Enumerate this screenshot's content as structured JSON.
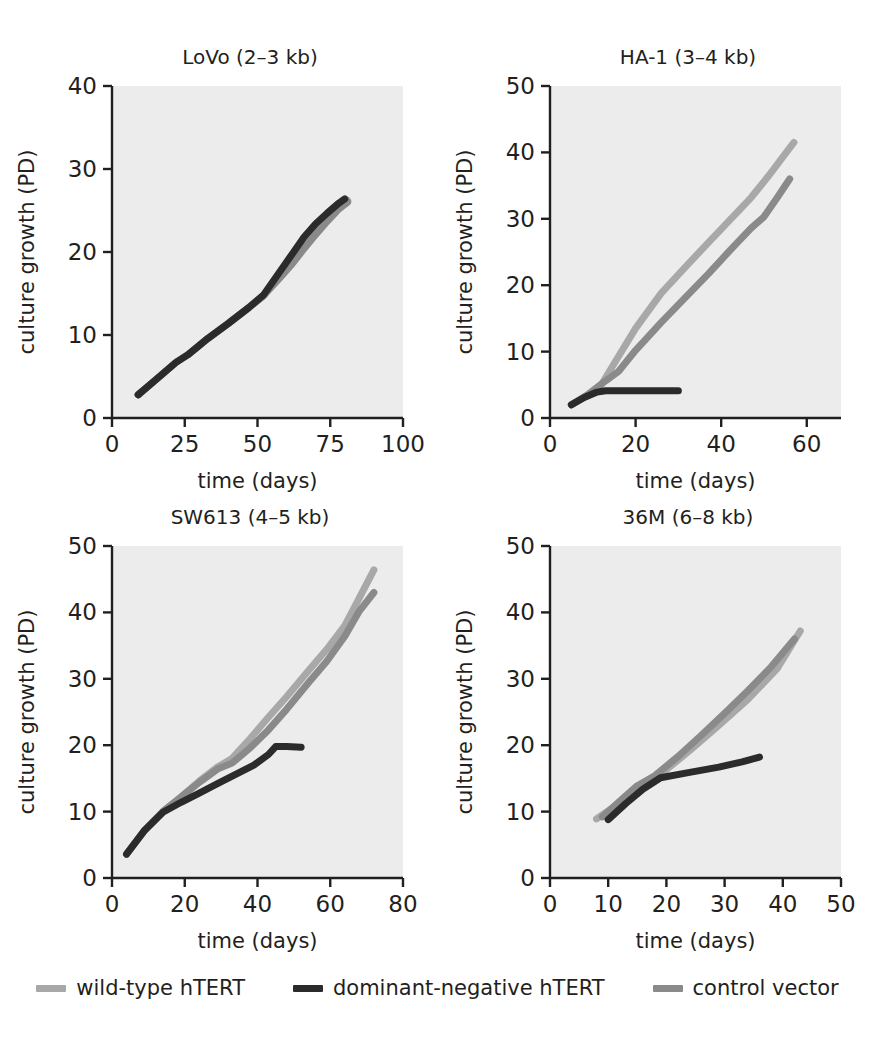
{
  "figure": {
    "background": "#ffffff",
    "plot_background": "#ececec",
    "axis_color": "#231f20"
  },
  "series_colors": {
    "wild_type": "#a8a8a8",
    "dominant_negative": "#2b2b2b",
    "control_vector": "#8a8a8a"
  },
  "legend": {
    "items": [
      {
        "label": "wild-type hTERT",
        "color": "#a8a8a8",
        "key": "wild_type"
      },
      {
        "label": "dominant-negative hTERT",
        "color": "#2b2b2b",
        "key": "dominant_negative"
      },
      {
        "label": "control vector",
        "color": "#8a8a8a",
        "key": "control_vector"
      }
    ]
  },
  "chart_data": [
    {
      "id": "lovo",
      "type": "line",
      "title": "LoVo (2–3 kb)",
      "xlabel": "time (days)",
      "ylabel": "culture growth (PD)",
      "xlim": [
        0,
        100
      ],
      "ylim": [
        0,
        40
      ],
      "xticks": [
        0,
        25,
        50,
        75,
        100
      ],
      "yticks": [
        0,
        10,
        20,
        30,
        40
      ],
      "grid": false,
      "legend_position": "below-figure",
      "series": [
        {
          "name": "wild-type hTERT",
          "color": "#a8a8a8",
          "x": [
            9,
            15,
            22,
            26,
            33,
            40,
            47,
            52,
            57,
            62,
            66,
            70,
            74,
            78,
            81
          ],
          "y": [
            2.8,
            4.6,
            6.7,
            7.6,
            9.6,
            11.4,
            13.3,
            14.7,
            16.8,
            19.0,
            20.9,
            22.5,
            24.0,
            25.5,
            26.2
          ]
        },
        {
          "name": "dominant-negative hTERT",
          "color": "#2b2b2b",
          "x": [
            9,
            15,
            22,
            26,
            33,
            40,
            47,
            52,
            57,
            62,
            66,
            70,
            74,
            78,
            80
          ],
          "y": [
            2.8,
            4.6,
            6.7,
            7.6,
            9.6,
            11.4,
            13.3,
            14.8,
            17.3,
            19.8,
            21.8,
            23.4,
            24.7,
            25.9,
            26.4
          ]
        },
        {
          "name": "control vector",
          "color": "#8a8a8a",
          "x": [
            9,
            15,
            22,
            26,
            33,
            40,
            47,
            52,
            57,
            62,
            66,
            70,
            74,
            78,
            81
          ],
          "y": [
            2.8,
            4.6,
            6.7,
            7.6,
            9.6,
            11.4,
            13.3,
            14.7,
            16.6,
            18.6,
            20.4,
            22.1,
            23.7,
            25.2,
            26.0
          ]
        }
      ]
    },
    {
      "id": "ha1",
      "type": "line",
      "title": "HA-1 (3–4 kb)",
      "xlabel": "time (days)",
      "ylabel": "culture growth (PD)",
      "xlim": [
        0,
        68
      ],
      "ylim": [
        0,
        50
      ],
      "xticks": [
        0,
        20,
        40,
        60
      ],
      "yticks": [
        0,
        10,
        20,
        30,
        40,
        50
      ],
      "grid": false,
      "legend_position": "below-figure",
      "series": [
        {
          "name": "wild-type hTERT",
          "color": "#a8a8a8",
          "x": [
            5,
            9,
            12,
            15,
            20,
            26,
            32,
            37,
            42,
            47,
            51,
            55,
            57
          ],
          "y": [
            2.0,
            3.5,
            5.0,
            8.2,
            13.5,
            18.8,
            23.0,
            26.4,
            29.8,
            33.2,
            36.4,
            39.8,
            41.5
          ]
        },
        {
          "name": "dominant-negative hTERT",
          "color": "#2b2b2b",
          "x": [
            5,
            8,
            11,
            13,
            16,
            20,
            25,
            30
          ],
          "y": [
            2.0,
            3.1,
            3.9,
            4.1,
            4.1,
            4.1,
            4.1,
            4.1
          ]
        },
        {
          "name": "control vector",
          "color": "#8a8a8a",
          "x": [
            5,
            9,
            13,
            16,
            20,
            26,
            32,
            37,
            42,
            47,
            50,
            53,
            56
          ],
          "y": [
            2.0,
            3.6,
            5.6,
            7.0,
            10.2,
            14.4,
            18.4,
            21.7,
            25.2,
            28.6,
            30.3,
            33.1,
            36.0
          ]
        }
      ]
    },
    {
      "id": "sw613",
      "type": "line",
      "title": "SW613 (4–5 kb)",
      "xlabel": "time (days)",
      "ylabel": "culture growth (PD)",
      "xlim": [
        0,
        80
      ],
      "ylim": [
        0,
        50
      ],
      "xticks": [
        0,
        20,
        40,
        60,
        80
      ],
      "yticks": [
        0,
        10,
        20,
        30,
        40,
        50
      ],
      "grid": false,
      "legend_position": "below-figure",
      "series": [
        {
          "name": "wild-type hTERT",
          "color": "#a8a8a8",
          "x": [
            4,
            9,
            14,
            19,
            24,
            29,
            33,
            38,
            43,
            48,
            54,
            59,
            64,
            68,
            72
          ],
          "y": [
            3.6,
            7.2,
            10.0,
            12.2,
            14.6,
            16.7,
            18.0,
            21.0,
            24.2,
            27.3,
            31.2,
            34.4,
            38.0,
            42.2,
            46.4
          ]
        },
        {
          "name": "dominant-negative hTERT",
          "color": "#2b2b2b",
          "x": [
            4,
            9,
            14,
            19,
            24,
            29,
            34,
            39,
            43,
            45,
            48,
            52
          ],
          "y": [
            3.6,
            7.2,
            9.9,
            11.4,
            12.8,
            14.2,
            15.6,
            17.0,
            18.6,
            19.8,
            19.8,
            19.7
          ]
        },
        {
          "name": "control vector",
          "color": "#8a8a8a",
          "x": [
            4,
            9,
            14,
            19,
            24,
            29,
            33,
            38,
            43,
            48,
            54,
            59,
            64,
            68,
            72
          ],
          "y": [
            3.6,
            7.2,
            10.0,
            12.2,
            14.4,
            16.4,
            17.3,
            19.6,
            22.3,
            25.4,
            29.4,
            32.6,
            36.4,
            40.2,
            43.0
          ]
        }
      ]
    },
    {
      "id": "m36",
      "type": "line",
      "title": "36M (6–8 kb)",
      "xlabel": "time (days)",
      "ylabel": "culture growth (PD)",
      "xlim": [
        0,
        50
      ],
      "ylim": [
        0,
        50
      ],
      "xticks": [
        0,
        10,
        20,
        30,
        40,
        50
      ],
      "yticks": [
        0,
        10,
        20,
        30,
        40,
        50
      ],
      "grid": false,
      "legend_position": "below-figure",
      "series": [
        {
          "name": "wild-type hTERT",
          "color": "#a8a8a8",
          "x": [
            8,
            12,
            16,
            19,
            24,
            29,
            34,
            39,
            43
          ],
          "y": [
            8.9,
            11.3,
            13.8,
            15.6,
            19.2,
            23.0,
            26.9,
            31.5,
            37.2
          ]
        },
        {
          "name": "dominant-negative hTERT",
          "color": "#2b2b2b",
          "x": [
            10,
            13,
            16,
            19,
            24,
            29,
            33,
            36
          ],
          "y": [
            8.8,
            11.2,
            13.4,
            15.1,
            15.9,
            16.7,
            17.5,
            18.2
          ]
        },
        {
          "name": "control vector",
          "color": "#8a8a8a",
          "x": [
            9,
            12,
            15,
            18,
            22,
            26,
            30,
            34,
            38,
            42
          ],
          "y": [
            9.2,
            11.6,
            13.9,
            15.4,
            18.3,
            21.5,
            24.8,
            28.2,
            31.8,
            36.0
          ]
        }
      ]
    }
  ]
}
